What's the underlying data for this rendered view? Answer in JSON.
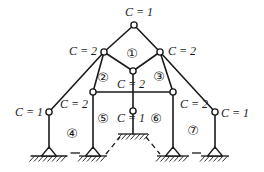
{
  "figure": {
    "canvas": {
      "width": 264,
      "height": 172
    },
    "colors": {
      "ink": "#1a1a1a",
      "background": "#ffffff",
      "hinge_fill": "#ffffff"
    },
    "hinges": [
      {
        "id": "apex",
        "x": 134,
        "y": 25,
        "label": "C = 1",
        "lx": 139,
        "ly": 12
      },
      {
        "id": "upper-left",
        "x": 104,
        "y": 52,
        "label": "C = 2",
        "lx": 83,
        "ly": 51
      },
      {
        "id": "upper-right",
        "x": 160,
        "y": 52,
        "label": "C = 2",
        "lx": 182,
        "ly": 51
      },
      {
        "id": "diamond-bottom",
        "x": 133,
        "y": 71,
        "label": "C = 2",
        "lx": 131,
        "ly": 84
      },
      {
        "id": "beam-left",
        "x": 93,
        "y": 92,
        "label": "C = 2",
        "lx": 74,
        "ly": 104
      },
      {
        "id": "beam-right",
        "x": 173,
        "y": 92,
        "label": "C = 2",
        "lx": 194,
        "ly": 104
      },
      {
        "id": "outer-left",
        "x": 49,
        "y": 112,
        "label": "C = 1",
        "lx": 29,
        "ly": 112
      },
      {
        "id": "outer-right",
        "x": 215,
        "y": 112,
        "label": "C = 1",
        "lx": 235,
        "ly": 113
      },
      {
        "id": "center-lower",
        "x": 133,
        "y": 111,
        "label": "C = 1",
        "lx": 131,
        "ly": 118
      }
    ],
    "members": [
      {
        "name": "member-apex-to-upper-left",
        "x1": 134,
        "y1": 25,
        "x2": 104,
        "y2": 52
      },
      {
        "name": "member-apex-to-upper-right",
        "x1": 134,
        "y1": 25,
        "x2": 160,
        "y2": 52
      },
      {
        "name": "member-upper-left-to-diamond",
        "x1": 104,
        "y1": 52,
        "x2": 133,
        "y2": 71
      },
      {
        "name": "member-upper-right-to-diamond",
        "x1": 160,
        "y1": 52,
        "x2": 133,
        "y2": 71
      },
      {
        "name": "member-upper-left-to-outer-left",
        "x1": 104,
        "y1": 52,
        "x2": 49,
        "y2": 112
      },
      {
        "name": "member-upper-right-to-outer-right",
        "x1": 160,
        "y1": 52,
        "x2": 215,
        "y2": 112
      },
      {
        "name": "member-upper-left-to-beam-left",
        "x1": 104,
        "y1": 52,
        "x2": 93,
        "y2": 92
      },
      {
        "name": "member-upper-right-to-beam-right",
        "x1": 160,
        "y1": 52,
        "x2": 173,
        "y2": 92
      },
      {
        "name": "member-horizontal-beam",
        "x1": 93,
        "y1": 92,
        "x2": 173,
        "y2": 92
      },
      {
        "name": "member-center-vertical",
        "x1": 133,
        "y1": 71,
        "x2": 133,
        "y2": 134
      },
      {
        "name": "member-outer-left-column",
        "x1": 49,
        "y1": 112,
        "x2": 49,
        "y2": 148
      },
      {
        "name": "member-inner-left-column",
        "x1": 93,
        "y1": 92,
        "x2": 93,
        "y2": 148
      },
      {
        "name": "member-inner-right-column",
        "x1": 173,
        "y1": 92,
        "x2": 173,
        "y2": 148
      },
      {
        "name": "member-outer-right-column",
        "x1": 215,
        "y1": 112,
        "x2": 215,
        "y2": 148
      }
    ],
    "pin_supports": [
      {
        "x": 49,
        "half": 18.5
      },
      {
        "x": 93,
        "half": 14
      },
      {
        "x": 173,
        "half": 16
      },
      {
        "x": 215,
        "half": 14
      }
    ],
    "pin_ground_y": 156,
    "pin_triangle_height": 9,
    "pin_triangle_half": 7.5,
    "fixed_support": {
      "x": 133,
      "y": 134,
      "half": 15
    },
    "ground_dashes": [
      {
        "x1": 70.5,
        "y1": 153,
        "x2": 80,
        "y2": 153,
        "dash": ""
      },
      {
        "x1": 106,
        "y1": 154,
        "x2": 120,
        "y2": 137,
        "dash": "5 4"
      },
      {
        "x1": 146,
        "y1": 137,
        "x2": 160,
        "y2": 154,
        "dash": "5 4"
      },
      {
        "x1": 192,
        "y1": 153,
        "x2": 201,
        "y2": 153,
        "dash": ""
      }
    ],
    "regions": [
      {
        "id": 1,
        "symbol": "①",
        "x": 132,
        "y": 53
      },
      {
        "id": 2,
        "symbol": "②",
        "x": 103,
        "y": 77
      },
      {
        "id": 3,
        "symbol": "③",
        "x": 159,
        "y": 76
      },
      {
        "id": 4,
        "symbol": "④",
        "x": 72,
        "y": 133
      },
      {
        "id": 5,
        "symbol": "⑤",
        "x": 103,
        "y": 118
      },
      {
        "id": 6,
        "symbol": "⑥",
        "x": 156,
        "y": 118
      },
      {
        "id": 7,
        "symbol": "⑦",
        "x": 193,
        "y": 130
      }
    ]
  }
}
